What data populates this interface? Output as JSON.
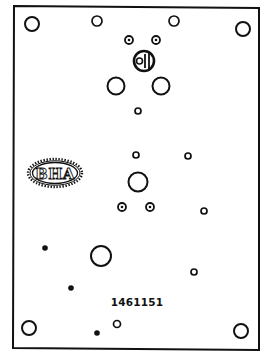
{
  "drawing": {
    "type": "technical-plate-drawing",
    "part_number": "1461151",
    "logo_text": "BHA",
    "colors": {
      "line": "#111111",
      "background": "#ffffff"
    },
    "frame": {
      "points": [
        [
          14,
          6
        ],
        [
          259,
          8
        ],
        [
          259,
          350
        ],
        [
          13,
          348
        ]
      ]
    },
    "holes": {
      "open": [
        {
          "id": "corner-top-left",
          "cx": 32,
          "cy": 24,
          "r": 7
        },
        {
          "id": "top-left-inner",
          "cx": 97,
          "cy": 21,
          "r": 5
        },
        {
          "id": "top-right-inner",
          "cx": 174,
          "cy": 21,
          "r": 5
        },
        {
          "id": "corner-top-right",
          "cx": 243,
          "cy": 29,
          "r": 7
        },
        {
          "id": "upper-left-large",
          "cx": 116,
          "cy": 86,
          "r": 8.5
        },
        {
          "id": "upper-right-large",
          "cx": 161,
          "cy": 86,
          "r": 8.5
        },
        {
          "id": "upper-small",
          "cx": 138,
          "cy": 111,
          "r": 3
        },
        {
          "id": "mid-small-left",
          "cx": 136,
          "cy": 155,
          "r": 3
        },
        {
          "id": "mid-small-right",
          "cx": 188,
          "cy": 156,
          "r": 3
        },
        {
          "id": "mid-large",
          "cx": 138,
          "cy": 182,
          "r": 9.5
        },
        {
          "id": "mid-small-far-right",
          "cx": 204,
          "cy": 211,
          "r": 3
        },
        {
          "id": "lower-large",
          "cx": 101,
          "cy": 256,
          "r": 10
        },
        {
          "id": "lower-small-right",
          "cx": 194,
          "cy": 272,
          "r": 3
        },
        {
          "id": "lower-small-center",
          "cx": 117,
          "cy": 324,
          "r": 3.5
        },
        {
          "id": "corner-bottom-left",
          "cx": 29,
          "cy": 328,
          "r": 7
        },
        {
          "id": "corner-bottom-right",
          "cx": 241,
          "cy": 331,
          "r": 7
        }
      ],
      "ring_dot": [
        {
          "id": "upper-ring-left",
          "cx": 129,
          "cy": 40,
          "r": 4
        },
        {
          "id": "upper-ring-right",
          "cx": 156,
          "cy": 40,
          "r": 4
        },
        {
          "id": "mid-ring-left",
          "cx": 122,
          "cy": 207,
          "r": 4
        },
        {
          "id": "mid-ring-right",
          "cx": 150,
          "cy": 207,
          "r": 4
        }
      ],
      "solid": [
        {
          "id": "dot-upper-left",
          "cx": 45,
          "cy": 248,
          "r": 2.8
        },
        {
          "id": "dot-mid-left",
          "cx": 71,
          "cy": 288,
          "r": 2.8
        },
        {
          "id": "dot-bottom",
          "cx": 97,
          "cy": 333,
          "r": 2.8
        }
      ],
      "slotted_connector": {
        "id": "center-connector",
        "cx": 144,
        "cy": 61,
        "r": 10
      }
    },
    "logo": {
      "cx": 55,
      "cy": 173,
      "rx": 27,
      "ry": 14
    },
    "label_position": {
      "x": 137,
      "y": 306
    }
  }
}
